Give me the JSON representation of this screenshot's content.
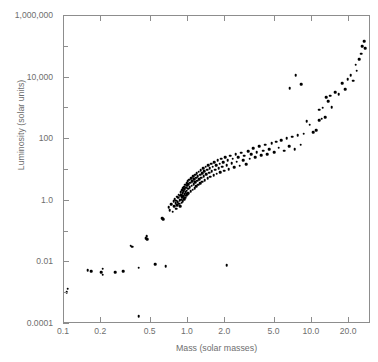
{
  "chart_data": {
    "type": "scatter",
    "title": "",
    "xlabel": "Mass (solar masses)",
    "ylabel": "Luminosity (solar units)",
    "xscale": "log",
    "yscale": "log",
    "xlim": [
      0.1,
      30
    ],
    "ylim": [
      0.0001,
      1000000
    ],
    "grid": false,
    "legend": null,
    "xticks": [
      0.1,
      0.2,
      0.5,
      1.0,
      2.0,
      5.0,
      10.0,
      20.0
    ],
    "xticklabels": [
      "0.1",
      "0.2",
      "0.5",
      "1.0",
      "2.0",
      "5.0",
      "10.0",
      "20.0"
    ],
    "yticks": [
      0.0001,
      0.01,
      1.0,
      100,
      10000,
      1000000
    ],
    "yticklabels": [
      "0.0001",
      "0.01",
      "1.0",
      "100",
      "10,000",
      "1,000,000"
    ],
    "yminorticks": [
      0.001,
      0.1,
      10,
      1000,
      100000
    ],
    "marker": "filled-circle",
    "marker_color": "#000000",
    "axis_color": "#8d8d8d",
    "label_color": "#6e6e6e",
    "background": "#ffffff",
    "points": [
      [
        0.105,
        0.0011
      ],
      [
        0.107,
        0.0014
      ],
      [
        0.155,
        0.0055
      ],
      [
        0.165,
        0.0052
      ],
      [
        0.2,
        0.0049
      ],
      [
        0.205,
        0.0062
      ],
      [
        0.205,
        0.004
      ],
      [
        0.26,
        0.0049
      ],
      [
        0.3,
        0.0051
      ],
      [
        0.345,
        0.035
      ],
      [
        0.355,
        0.032
      ],
      [
        0.4,
        0.0068
      ],
      [
        0.4,
        0.00018
      ],
      [
        0.455,
        0.062
      ],
      [
        0.465,
        0.07
      ],
      [
        0.47,
        0.056
      ],
      [
        0.545,
        0.0088
      ],
      [
        0.62,
        0.27
      ],
      [
        0.635,
        0.25
      ],
      [
        0.66,
        0.0076
      ],
      [
        0.7,
        0.62
      ],
      [
        0.715,
        0.5
      ],
      [
        0.735,
        0.78
      ],
      [
        0.755,
        0.44
      ],
      [
        0.765,
        0.95
      ],
      [
        0.775,
        0.67
      ],
      [
        0.785,
        1.15
      ],
      [
        0.795,
        0.85
      ],
      [
        0.8,
        0.55
      ],
      [
        0.805,
        1.0
      ],
      [
        0.815,
        1.35
      ],
      [
        0.82,
        0.72
      ],
      [
        0.825,
        0.92
      ],
      [
        0.835,
        1.25
      ],
      [
        0.845,
        1.6
      ],
      [
        0.85,
        0.8
      ],
      [
        0.855,
        1.05
      ],
      [
        0.86,
        1.45
      ],
      [
        0.865,
        0.66
      ],
      [
        0.875,
        1.9
      ],
      [
        0.88,
        1.1
      ],
      [
        0.885,
        1.55
      ],
      [
        0.89,
        0.88
      ],
      [
        0.895,
        2.2
      ],
      [
        0.9,
        1.3
      ],
      [
        0.905,
        1.75
      ],
      [
        0.91,
        0.98
      ],
      [
        0.915,
        2.6
      ],
      [
        0.92,
        1.42
      ],
      [
        0.925,
        2.05
      ],
      [
        0.93,
        1.15
      ],
      [
        0.935,
        2.9
      ],
      [
        0.94,
        1.65
      ],
      [
        0.945,
        2.35
      ],
      [
        0.95,
        1.28
      ],
      [
        0.955,
        3.3
      ],
      [
        0.96,
        1.88
      ],
      [
        0.965,
        2.7
      ],
      [
        0.97,
        1.45
      ],
      [
        0.975,
        3.8
      ],
      [
        0.98,
        2.15
      ],
      [
        0.985,
        3.05
      ],
      [
        0.99,
        1.62
      ],
      [
        0.995,
        4.3
      ],
      [
        1.0,
        2.45
      ],
      [
        1.005,
        3.45
      ],
      [
        1.01,
        1.8
      ],
      [
        1.02,
        4.9
      ],
      [
        1.03,
        2.75
      ],
      [
        1.04,
        3.9
      ],
      [
        1.05,
        2.05
      ],
      [
        1.06,
        5.5
      ],
      [
        1.07,
        3.1
      ],
      [
        1.08,
        4.4
      ],
      [
        1.09,
        2.3
      ],
      [
        1.1,
        6.2
      ],
      [
        1.11,
        3.5
      ],
      [
        1.12,
        4.95
      ],
      [
        1.13,
        2.6
      ],
      [
        1.14,
        7.0
      ],
      [
        1.15,
        3.95
      ],
      [
        1.16,
        5.6
      ],
      [
        1.17,
        2.95
      ],
      [
        1.18,
        7.9
      ],
      [
        1.19,
        4.45
      ],
      [
        1.2,
        6.3
      ],
      [
        1.21,
        3.3
      ],
      [
        1.22,
        8.9
      ],
      [
        1.23,
        5.0
      ],
      [
        1.25,
        7.1
      ],
      [
        1.26,
        3.75
      ],
      [
        1.27,
        10.0
      ],
      [
        1.28,
        5.65
      ],
      [
        1.3,
        8.0
      ],
      [
        1.31,
        4.2
      ],
      [
        1.33,
        11.3
      ],
      [
        1.34,
        6.35
      ],
      [
        1.36,
        9.0
      ],
      [
        1.37,
        4.75
      ],
      [
        1.39,
        12.7
      ],
      [
        1.41,
        7.15
      ],
      [
        1.43,
        10.1
      ],
      [
        1.44,
        5.35
      ],
      [
        1.46,
        14.3
      ],
      [
        1.48,
        8.05
      ],
      [
        1.5,
        11.4
      ],
      [
        1.52,
        6.0
      ],
      [
        1.54,
        16.1
      ],
      [
        1.56,
        9.05
      ],
      [
        1.59,
        12.8
      ],
      [
        1.61,
        6.75
      ],
      [
        1.63,
        18.1
      ],
      [
        1.66,
        10.2
      ],
      [
        1.69,
        14.4
      ],
      [
        1.71,
        7.6
      ],
      [
        1.74,
        20.4
      ],
      [
        1.77,
        11.5
      ],
      [
        1.8,
        16.2
      ],
      [
        1.83,
        8.55
      ],
      [
        1.86,
        23.0
      ],
      [
        1.9,
        12.9
      ],
      [
        1.93,
        18.3
      ],
      [
        1.97,
        9.6
      ],
      [
        2.0,
        25.8
      ],
      [
        2.05,
        14.6
      ],
      [
        2.1,
        20.6
      ],
      [
        2.14,
        10.8
      ],
      [
        2.19,
        29.0
      ],
      [
        2.25,
        16.4
      ],
      [
        2.3,
        23.2
      ],
      [
        2.36,
        12.2
      ],
      [
        2.42,
        32.7
      ],
      [
        2.48,
        18.5
      ],
      [
        2.55,
        26.1
      ],
      [
        2.62,
        13.7
      ],
      [
        2.7,
        36.8
      ],
      [
        2.78,
        20.8
      ],
      [
        2.86,
        29.4
      ],
      [
        2.95,
        15.5
      ],
      [
        3.05,
        41.4
      ],
      [
        3.15,
        23.4
      ],
      [
        3.25,
        33.1
      ],
      [
        3.36,
        52.0
      ],
      [
        3.48,
        26.3
      ],
      [
        3.6,
        37.2
      ],
      [
        3.74,
        58.5
      ],
      [
        3.88,
        29.6
      ],
      [
        4.03,
        41.9
      ],
      [
        4.19,
        66.0
      ],
      [
        4.36,
        33.3
      ],
      [
        4.55,
        47.2
      ],
      [
        4.74,
        74.0
      ],
      [
        4.95,
        37.5
      ],
      [
        5.18,
        83.5
      ],
      [
        5.42,
        53.0
      ],
      [
        5.68,
        94.0
      ],
      [
        5.96,
        42.2
      ],
      [
        6.26,
        106
      ],
      [
        6.58,
        59.6
      ],
      [
        6.92,
        119
      ],
      [
        7.29,
        47.5
      ],
      [
        7.69,
        134
      ],
      [
        8.12,
        67.0
      ],
      [
        8.58,
        151
      ],
      [
        9.08,
        380
      ],
      [
        9.62,
        300
      ],
      [
        10.2,
        170
      ],
      [
        10.8,
        195
      ],
      [
        11.5,
        900
      ],
      [
        11.5,
        420
      ],
      [
        12.0,
        470
      ],
      [
        12.2,
        1050
      ],
      [
        12.8,
        520
      ],
      [
        13.0,
        2300
      ],
      [
        13.5,
        1700
      ],
      [
        14.0,
        2600
      ],
      [
        14.5,
        1100
      ],
      [
        15.5,
        3400
      ],
      [
        16.5,
        2900
      ],
      [
        17.5,
        6500
      ],
      [
        18.5,
        4200
      ],
      [
        19.5,
        9000
      ],
      [
        20.5,
        12000
      ],
      [
        21.5,
        8000
      ],
      [
        22.5,
        26000
      ],
      [
        23.0,
        17000
      ],
      [
        24.0,
        40000
      ],
      [
        25.0,
        60000
      ],
      [
        25.5,
        105000
      ],
      [
        26.5,
        150000
      ],
      [
        27.0,
        90000
      ],
      [
        6.6,
        4500
      ],
      [
        7.4,
        12000
      ],
      [
        8.2,
        6000
      ],
      [
        2.05,
        0.008
      ]
    ]
  },
  "figure": {
    "credit": ""
  }
}
